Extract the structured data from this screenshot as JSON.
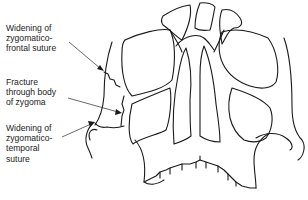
{
  "figure": {
    "labels": [
      {
        "id": "zygomatico-frontal",
        "lines": [
          "Widening of",
          "zygomatico-",
          "frontal suture"
        ]
      },
      {
        "id": "body-of-zygoma",
        "lines": [
          "Fracture",
          "through body",
          "of zygoma"
        ]
      },
      {
        "id": "zygomatico-temporal",
        "lines": [
          "Widening of",
          "zygomatico-",
          "temporal",
          "suture"
        ]
      }
    ],
    "colors": {
      "line": "#1a1a1a",
      "text": "#222222",
      "background": "#ffffff"
    }
  }
}
